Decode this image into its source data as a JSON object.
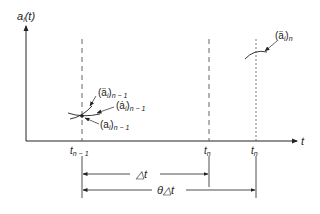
{
  "diagram": {
    "y_axis_label": {
      "main": "a",
      "sub": "i",
      "arg": "(t)"
    },
    "x_axis_label": "t",
    "ticks": [
      {
        "base": "t",
        "sub": "n − 1"
      },
      {
        "base": "t",
        "sub": "n"
      },
      {
        "base": "t",
        "sub": "n"
      }
    ],
    "annotations": [
      {
        "name": "acceleration-prev",
        "main": "(ä",
        "sub_i": "i",
        "close": ")",
        "sub": "n − 1"
      },
      {
        "name": "velocity-prev",
        "main": "(ȧ",
        "sub_i": "i",
        "close": ")",
        "sub": "n − 1"
      },
      {
        "name": "displacement-prev",
        "main": "(a",
        "sub_i": "i",
        "close": ")",
        "sub": "n − 1"
      },
      {
        "name": "acceleration-next",
        "main": "(ä",
        "sub_i": "i",
        "close": ")",
        "sub": "n"
      }
    ],
    "intervals": [
      {
        "name": "delta-t",
        "label": "△t"
      },
      {
        "name": "theta-delta-t",
        "label": "θ△t"
      }
    ],
    "colors": {
      "line": "#222222",
      "dash": "#555555",
      "background": "#ffffff"
    }
  }
}
